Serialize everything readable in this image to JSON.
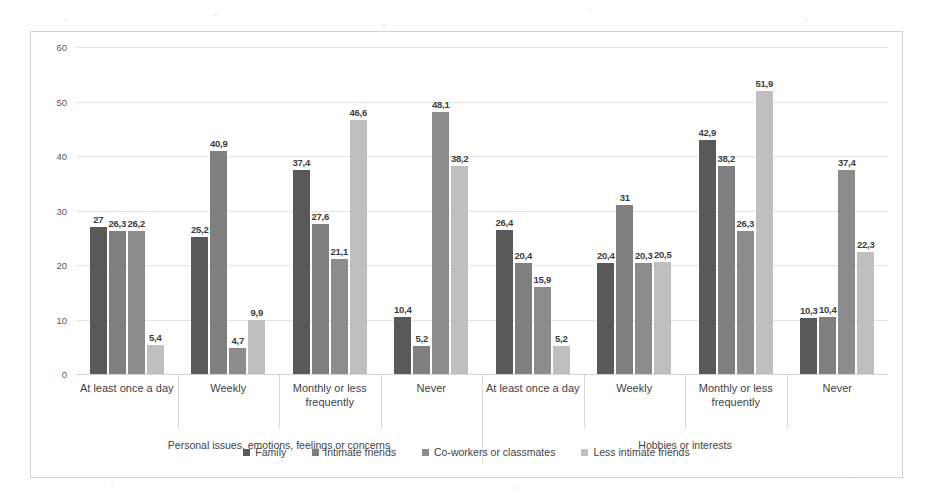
{
  "chart_data": {
    "type": "bar",
    "title": "",
    "xlabel": "",
    "ylabel": "",
    "ylim": [
      0,
      60
    ],
    "yticks": [
      0,
      10,
      20,
      30,
      40,
      50,
      60
    ],
    "grid": true,
    "legend_position": "bottom",
    "categories": [
      "At least once a day",
      "Weekly",
      "Monthly or less frequently",
      "Never",
      "At least once a day",
      "Weekly",
      "Monthly or less frequently",
      "Never"
    ],
    "outer_groups": [
      {
        "label": "Personal issues, emotions, feelings or concerns",
        "span": 4
      },
      {
        "label": "Hobbies or interests",
        "span": 4
      }
    ],
    "series": [
      {
        "name": "Family",
        "color": "#595959",
        "values": [
          27,
          25.2,
          37.4,
          10.4,
          26.4,
          20.4,
          42.9,
          10.3
        ],
        "labels": [
          "27",
          "25,2",
          "37,4",
          "10,4",
          "26,4",
          "20,4",
          "42,9",
          "10,3"
        ]
      },
      {
        "name": "Intimate friends",
        "color": "#7f7f7f",
        "values": [
          26.3,
          40.9,
          27.6,
          5.2,
          20.4,
          31,
          38.2,
          10.4
        ],
        "labels": [
          "26,3",
          "40,9",
          "27,6",
          "5,2",
          "20,4",
          "31",
          "38,2",
          "10,4"
        ]
      },
      {
        "name": "Co-workers or classmates",
        "color": "#8c8c8c",
        "values": [
          26.2,
          4.7,
          21.1,
          48.1,
          15.9,
          20.3,
          26.3,
          37.4
        ],
        "labels": [
          "26,2",
          "4,7",
          "21,1",
          "48,1",
          "15,9",
          "20,3",
          "26,3",
          "37,4"
        ]
      },
      {
        "name": "Less intimate friends",
        "color": "#bfbfbf",
        "values": [
          5.4,
          9.9,
          46.6,
          38.2,
          5.2,
          20.5,
          51.9,
          22.3
        ],
        "labels": [
          "5,4",
          "9,9",
          "46,6",
          "38,2",
          "5,2",
          "20,5",
          "51,9",
          "22,3"
        ]
      }
    ]
  }
}
